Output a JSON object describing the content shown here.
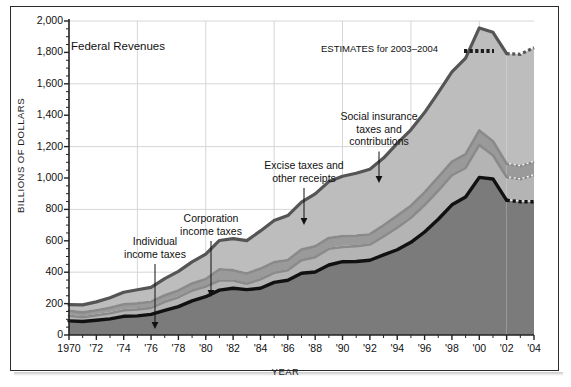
{
  "chart_data": {
    "type": "area",
    "title": "Federal Revenues",
    "xlabel": "YEAR",
    "ylabel": "BILLIONS OF DOLLARS",
    "ylim": [
      0,
      2000
    ],
    "xlim": [
      1970,
      2004
    ],
    "ytick_values": [
      0,
      200,
      400,
      600,
      800,
      1000,
      1200,
      1400,
      1600,
      1800,
      2000
    ],
    "ytick_labels": [
      "0",
      "200",
      "400",
      "600",
      "800",
      "1,000",
      "1,200",
      "1,400",
      "1,600",
      "1,800",
      "2,000"
    ],
    "gridline_values": [
      400,
      800,
      1200,
      1600,
      2000
    ],
    "grid": "both",
    "legend": "inline-annotations",
    "xtick_values": [
      1970,
      1972,
      1974,
      1976,
      1978,
      1980,
      1982,
      1984,
      1986,
      1988,
      1990,
      1992,
      1994,
      1996,
      1998,
      2000,
      2002,
      2004
    ],
    "xtick_labels": [
      "1970",
      "'72",
      "'74",
      "'76",
      "'78",
      "'80",
      "'82",
      "'84",
      "'86",
      "'88",
      "'90",
      "'92",
      "'94",
      "'96",
      "'98",
      "'00",
      "'02",
      "'04"
    ],
    "x": [
      1970,
      1971,
      1972,
      1973,
      1974,
      1975,
      1976,
      1977,
      1978,
      1979,
      1980,
      1981,
      1982,
      1983,
      1984,
      1985,
      1986,
      1987,
      1988,
      1989,
      1990,
      1991,
      1992,
      1993,
      1994,
      1995,
      1996,
      1997,
      1998,
      1999,
      2000,
      2001,
      2002,
      2003,
      2004
    ],
    "estimate_years": [
      2003,
      2004
    ],
    "series": [
      {
        "name": "Individual income taxes",
        "stack_order": 1,
        "fill": "#7b7b7b",
        "edge": "#111111",
        "values": [
          90,
          86,
          94,
          103,
          119,
          122,
          131,
          157,
          181,
          217,
          244,
          286,
          298,
          289,
          298,
          335,
          349,
          393,
          401,
          446,
          467,
          468,
          476,
          510,
          543,
          590,
          656,
          737,
          829,
          879,
          1004,
          994,
          858,
          849,
          849
        ]
      },
      {
        "name": "Corporation income taxes",
        "stack_order": 2,
        "fill": "#b4b4b4",
        "edge": "#8a8a8a",
        "values": [
          33,
          27,
          32,
          36,
          39,
          41,
          42,
          55,
          60,
          66,
          65,
          61,
          49,
          37,
          57,
          61,
          63,
          84,
          95,
          103,
          94,
          98,
          100,
          118,
          141,
          157,
          172,
          182,
          189,
          185,
          207,
          151,
          148,
          143,
          169
        ]
      },
      {
        "name": "Excise taxes and other receipts",
        "stack_order": 3,
        "fill": "#9a9a9a",
        "edge": "#8a8a8a",
        "values": [
          31,
          31,
          32,
          34,
          38,
          39,
          39,
          41,
          43,
          45,
          48,
          72,
          66,
          66,
          68,
          68,
          66,
          67,
          69,
          69,
          70,
          68,
          66,
          71,
          76,
          76,
          80,
          86,
          86,
          88,
          92,
          89,
          85,
          83,
          86
        ]
      },
      {
        "name": "Social insurance taxes and contributions",
        "stack_order": 4,
        "fill": "#bdbdbd",
        "edge": "#555555",
        "values": [
          39,
          48,
          53,
          64,
          76,
          86,
          91,
          106,
          121,
          138,
          158,
          183,
          201,
          209,
          240,
          265,
          283,
          303,
          334,
          359,
          380,
          396,
          414,
          428,
          461,
          484,
          509,
          539,
          572,
          612,
          653,
          694,
          701,
          713,
          726
        ]
      }
    ],
    "totals": [
      193,
      192,
      211,
      237,
      272,
      288,
      303,
      359,
      405,
      466,
      515,
      602,
      614,
      601,
      663,
      729,
      761,
      847,
      899,
      977,
      1011,
      1030,
      1056,
      1127,
      1221,
      1307,
      1417,
      1544,
      1676,
      1764,
      1956,
      1928,
      1792,
      1788,
      1830
    ],
    "annotations": [
      {
        "id": "individual-income-taxes",
        "text": "Individual\nincome taxes",
        "x": 1974,
        "leader_to": [
          1974,
          55
        ]
      },
      {
        "id": "corporation-income-taxes",
        "text": "Corporation\nincome taxes",
        "x": 1978,
        "leader_to": [
          1978,
          205
        ]
      },
      {
        "id": "excise-taxes",
        "text": "Excise taxes and\nother receipts",
        "x": 1985.5,
        "leader_to": [
          1985.5,
          445
        ]
      },
      {
        "id": "social-insurance",
        "text": "Social insurance\ntaxes and\ncontributions",
        "x": 1990.5,
        "leader_to": [
          1990.5,
          830
        ]
      }
    ],
    "estimates_note": "ESTIMATES for 2003–2004"
  },
  "colors": {
    "frame": "#2b2b2b",
    "grid": "#d6d6d6",
    "axis": "#222222",
    "text": "#111111",
    "individual_fill": "#7b7b7b",
    "corporation_fill": "#b4b4b4",
    "excise_fill": "#9a9a9a",
    "social_fill": "#bdbdbd",
    "gap_fill": "#ffffff",
    "estimate_dot": "#1b1b1b"
  }
}
